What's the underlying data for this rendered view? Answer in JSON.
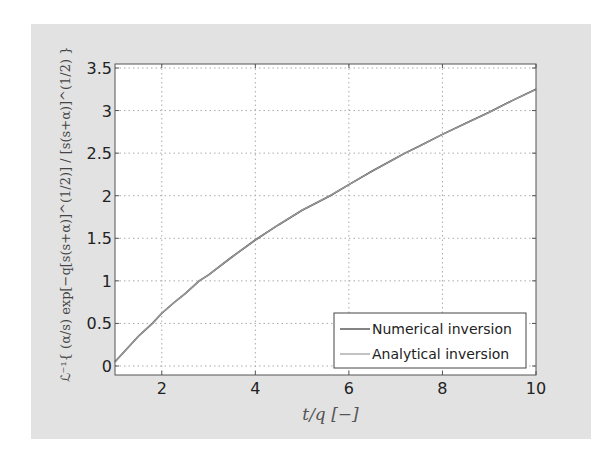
{
  "chart_data": {
    "type": "line",
    "title": "",
    "xlabel": "t/q   [−]",
    "ylabel": "ℒ⁻¹{ (α/s) exp[−q[s(s+α)]^(1/2)] / [s(s+α)]^(1/2) }",
    "xlim": [
      1,
      10
    ],
    "ylim": [
      -0.1,
      3.55
    ],
    "xticks": [
      2,
      4,
      6,
      8,
      10
    ],
    "xtick_labels": [
      "2",
      "4",
      "6",
      "8",
      "10"
    ],
    "yticks": [
      0,
      0.5,
      1,
      1.5,
      2,
      2.5,
      3,
      3.5
    ],
    "ytick_labels": [
      "0",
      "0.5",
      "1",
      "1.5",
      "2",
      "2.5",
      "3",
      "3.5"
    ],
    "grid": true,
    "legend_position": "bottom-right",
    "x": [
      1.0,
      1.25,
      1.5,
      1.8,
      2.0,
      2.25,
      2.5,
      2.8,
      3.0,
      3.5,
      4.0,
      4.5,
      5.0,
      5.6,
      6.0,
      6.5,
      7.0,
      7.2,
      7.5,
      8.0,
      8.5,
      9.0,
      9.5,
      10.0
    ],
    "series": [
      {
        "name": "Numerical inversion",
        "color": "#333333",
        "values": [
          0.05,
          0.2,
          0.35,
          0.5,
          0.62,
          0.74,
          0.85,
          1.0,
          1.07,
          1.28,
          1.48,
          1.66,
          1.83,
          2.0,
          2.13,
          2.29,
          2.44,
          2.5,
          2.58,
          2.72,
          2.85,
          2.98,
          3.12,
          3.25
        ]
      },
      {
        "name": "Analytical inversion",
        "color": "#9a9a9a",
        "values": [
          0.05,
          0.2,
          0.35,
          0.5,
          0.62,
          0.74,
          0.85,
          1.0,
          1.07,
          1.28,
          1.48,
          1.66,
          1.83,
          2.0,
          2.13,
          2.29,
          2.44,
          2.5,
          2.58,
          2.72,
          2.85,
          2.98,
          3.12,
          3.25
        ]
      }
    ]
  }
}
